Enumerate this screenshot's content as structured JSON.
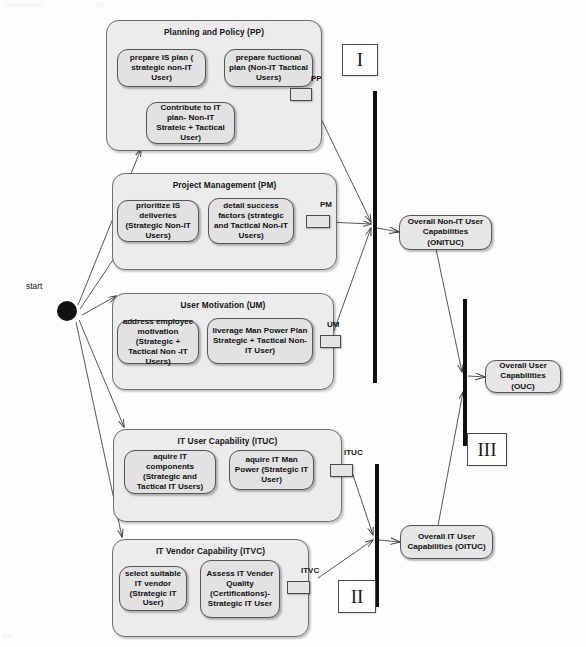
{
  "diagram": {
    "type": "uml-activity-diagram",
    "start_node_label": "start",
    "colors": {
      "lane_fill": "#ececec",
      "action_fill": "#e2e2e2",
      "capability_fill": "#e6e6e6",
      "stroke": "#555555",
      "bar": "#111111",
      "background": "#fdfdfd"
    }
  },
  "lanes": [
    {
      "id": "pp",
      "title": "Planning and Policy (PP)",
      "pin_label": "PP",
      "actions": [
        {
          "id": "pp_a1",
          "label": "prepare IS plan ( strategic non-IT User)"
        },
        {
          "id": "pp_a2",
          "label": "prepare fuctional plan (Non-IT Tactical Users)"
        },
        {
          "id": "pp_a3",
          "label": "Contribute to IT plan- Non-IT Strateic + Tactical User)"
        }
      ]
    },
    {
      "id": "pm",
      "title": "Project Management (PM)",
      "pin_label": "PM",
      "actions": [
        {
          "id": "pm_a1",
          "label": "prioritize IS deliveries (Strategic Non-IT Users)"
        },
        {
          "id": "pm_a2",
          "label": "detail success factors (strategic and Tactical Non-IT Users)"
        }
      ]
    },
    {
      "id": "um",
      "title": "User Motivation (UM)",
      "pin_label": "UM",
      "actions": [
        {
          "id": "um_a1",
          "label": "address employee motivation (Strategic + Tactical Non -IT Users)"
        },
        {
          "id": "um_a2",
          "label": "liverage Man Power Plan Strategic + Tactical Non-IT User)"
        }
      ]
    },
    {
      "id": "ituc",
      "title": "IT User Capability (ITUC)",
      "pin_label": "ITUC",
      "actions": [
        {
          "id": "ituc_a1",
          "label": "aquire IT components (Strategic and Tactical IT Users)"
        },
        {
          "id": "ituc_a2",
          "label": "aquire IT Man Power (Strategic IT User)"
        }
      ]
    },
    {
      "id": "itvc",
      "title": "IT Vendor Capability (ITVC)",
      "pin_label": "ITVC",
      "actions": [
        {
          "id": "itvc_a1",
          "label": "select suitable IT vendor (Strategic IT User)"
        },
        {
          "id": "itvc_a2",
          "label": "Assess IT Vender Quality (Certifications)- Strategic IT User"
        }
      ]
    }
  ],
  "capabilities": [
    {
      "id": "onituc",
      "label": "Overall Non-IT User Capabilities (ONITUC)"
    },
    {
      "id": "ouc",
      "label": "Overall User Capabilities (OUC)"
    },
    {
      "id": "oituc",
      "label": "Overall IT User Capabilities (OITUC)"
    }
  ],
  "phases": [
    {
      "id": "phase1",
      "label": "I"
    },
    {
      "id": "phase2",
      "label": "II"
    },
    {
      "id": "phase3",
      "label": "III"
    }
  ],
  "sync_bars": [
    {
      "id": "bar1",
      "name": "non-it-join-bar"
    },
    {
      "id": "bar2",
      "name": "it-join-bar"
    },
    {
      "id": "bar3",
      "name": "overall-join-bar"
    }
  ]
}
